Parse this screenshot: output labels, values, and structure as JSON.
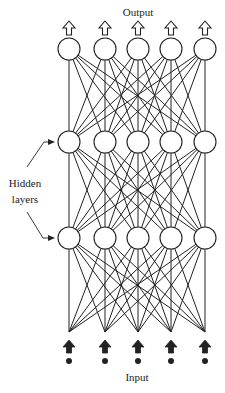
{
  "labels": {
    "output": "Output",
    "input": "Input",
    "hidden_line1": "Hidden",
    "hidden_line2": "layers"
  },
  "network": {
    "columns_x": [
      69,
      105,
      138,
      171,
      205
    ],
    "layers": [
      {
        "name": "output",
        "y": 49,
        "type": "node"
      },
      {
        "name": "hidden-1",
        "y": 142,
        "type": "node"
      },
      {
        "name": "hidden-2",
        "y": 238,
        "type": "node"
      },
      {
        "name": "input",
        "y": 332,
        "type": "point"
      }
    ],
    "node_radius": 11,
    "colors": {
      "stroke": "#222222",
      "fill": "#ffffff"
    }
  }
}
